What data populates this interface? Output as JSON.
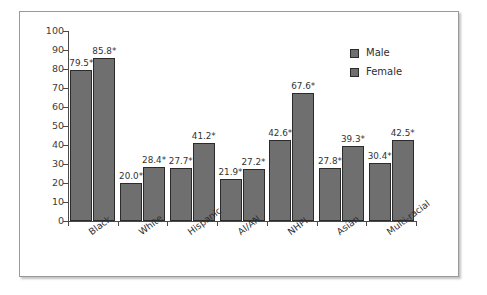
{
  "chart_data": {
    "type": "bar",
    "title": "",
    "xlabel": "",
    "ylabel": "",
    "ylim": [
      0,
      100
    ],
    "ytick_step": 10,
    "yticks": [
      "100",
      "90",
      "80",
      "70",
      "60",
      "50",
      "40",
      "30",
      "20",
      "10",
      "0"
    ],
    "grid": false,
    "legend_position": "upper right",
    "categories": [
      "Black",
      "White",
      "Hispanic",
      "AI/AN",
      "NHPI",
      "Asian",
      "Multi-racial"
    ],
    "series": [
      {
        "name": "Male",
        "values": [
          79.5,
          20.0,
          27.7,
          21.9,
          42.6,
          27.8,
          30.4
        ],
        "labels": [
          "79.5*",
          "20.0*",
          "27.7*",
          "21.9*",
          "42.6*",
          "27.8*",
          "30.4*"
        ],
        "color": "#6f6f6f"
      },
      {
        "name": "Female",
        "values": [
          85.8,
          28.4,
          41.2,
          27.2,
          67.6,
          39.3,
          42.5
        ],
        "labels": [
          "85.8*",
          "28.4*",
          "41.2*",
          "27.2*",
          "67.6*",
          "39.3*",
          "42.5*"
        ],
        "color": "#6f6f6f"
      }
    ],
    "annotations": [
      "*"
    ]
  },
  "legend": {
    "items": [
      {
        "label": "Male",
        "color": "#6f6f6f"
      },
      {
        "label": "Female",
        "color": "#6f6f6f"
      }
    ]
  },
  "colors": {
    "bar_fill": "#6f6f6f",
    "bar_outline": "#2b2b2b",
    "axis": "#4a4a4a",
    "text": "#2e2e2e",
    "frame": "#9a9a9a",
    "background": "#ffffff"
  }
}
